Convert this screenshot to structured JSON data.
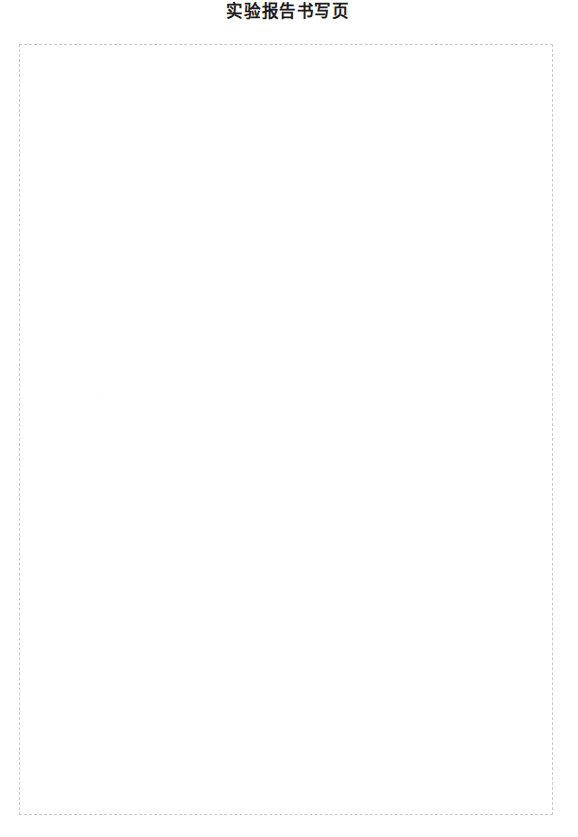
{
  "document": {
    "title": "实验报告书写页",
    "page_background_color": "#ffffff"
  },
  "writing_area": {
    "border_style": "dashed",
    "border_color": "#c9c9c9",
    "fill_color": "#ffffff",
    "content": ""
  }
}
